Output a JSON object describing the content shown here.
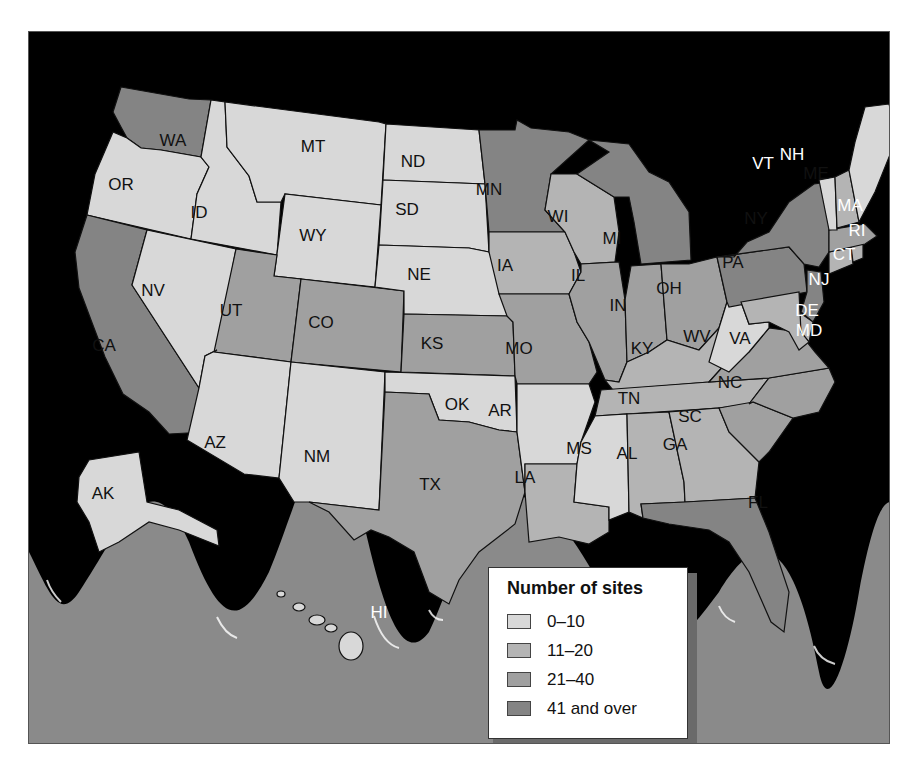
{
  "colors": {
    "frame_background": "#000000",
    "ocean_wave_band": "#8a8a8a",
    "outer_background": "#ffffff",
    "category_0_10": "#d8d8d8",
    "category_11_20": "#b4b4b4",
    "category_21_40": "#a0a0a0",
    "category_41_over": "#848484"
  },
  "legend": {
    "title": "Number of sites",
    "items": [
      {
        "label": "0–10",
        "color": "#d8d8d8"
      },
      {
        "label": "11–20",
        "color": "#b4b4b4"
      },
      {
        "label": "21–40",
        "color": "#a0a0a0"
      },
      {
        "label": "41 and over",
        "color": "#848484"
      }
    ]
  },
  "states": [
    {
      "code": "WA",
      "category": "41 and over"
    },
    {
      "code": "OR",
      "category": "0–10"
    },
    {
      "code": "CA",
      "category": "41 and over"
    },
    {
      "code": "ID",
      "category": "0–10"
    },
    {
      "code": "NV",
      "category": "0–10"
    },
    {
      "code": "MT",
      "category": "0–10"
    },
    {
      "code": "WY",
      "category": "0–10"
    },
    {
      "code": "UT",
      "category": "21–40"
    },
    {
      "code": "CO",
      "category": "21–40"
    },
    {
      "code": "AZ",
      "category": "0–10"
    },
    {
      "code": "NM",
      "category": "0–10"
    },
    {
      "code": "ND",
      "category": "0–10"
    },
    {
      "code": "SD",
      "category": "0–10"
    },
    {
      "code": "NE",
      "category": "0–10"
    },
    {
      "code": "KS",
      "category": "21–40"
    },
    {
      "code": "OK",
      "category": "0–10"
    },
    {
      "code": "TX",
      "category": "21–40"
    },
    {
      "code": "MN",
      "category": "41 and over"
    },
    {
      "code": "IA",
      "category": "11–20"
    },
    {
      "code": "MO",
      "category": "21–40"
    },
    {
      "code": "AR",
      "category": "0–10"
    },
    {
      "code": "LA",
      "category": "11–20"
    },
    {
      "code": "WI",
      "category": "11–20"
    },
    {
      "code": "IL",
      "category": "21–40"
    },
    {
      "code": "MI",
      "category": "41 and over"
    },
    {
      "code": "IN",
      "category": "21–40"
    },
    {
      "code": "OH",
      "category": "21–40"
    },
    {
      "code": "KY",
      "category": "11–20"
    },
    {
      "code": "TN",
      "category": "11–20"
    },
    {
      "code": "MS",
      "category": "0–10"
    },
    {
      "code": "AL",
      "category": "11–20"
    },
    {
      "code": "GA",
      "category": "11–20"
    },
    {
      "code": "FL",
      "category": "41 and over"
    },
    {
      "code": "SC",
      "category": "21–40"
    },
    {
      "code": "NC",
      "category": "21–40"
    },
    {
      "code": "VA",
      "category": "21–40"
    },
    {
      "code": "WV",
      "category": "0–10"
    },
    {
      "code": "PA",
      "category": "41 and over"
    },
    {
      "code": "NY",
      "category": "41 and over"
    },
    {
      "code": "NJ",
      "category": "41 and over"
    },
    {
      "code": "DE",
      "category": "11–20"
    },
    {
      "code": "MD",
      "category": "11–20"
    },
    {
      "code": "CT",
      "category": "11–20"
    },
    {
      "code": "RI",
      "category": "11–20"
    },
    {
      "code": "MA",
      "category": "21–40"
    },
    {
      "code": "VT",
      "category": "0–10"
    },
    {
      "code": "NH",
      "category": "11–20"
    },
    {
      "code": "ME",
      "category": "0–10"
    },
    {
      "code": "AK",
      "category": "0–10"
    },
    {
      "code": "HI",
      "category": "0–10"
    }
  ],
  "labels": {
    "WA": "WA",
    "OR": "OR",
    "CA": "CA",
    "ID": "ID",
    "NV": "NV",
    "MT": "MT",
    "WY": "WY",
    "UT": "UT",
    "CO": "CO",
    "AZ": "AZ",
    "NM": "NM",
    "ND": "ND",
    "SD": "SD",
    "NE": "NE",
    "KS": "KS",
    "OK": "OK",
    "TX": "TX",
    "MN": "MN",
    "IA": "IA",
    "MO": "MO",
    "AR": "AR",
    "LA": "LA",
    "WI": "WI",
    "IL": "IL",
    "MI": "MI",
    "IN": "IN",
    "OH": "OH",
    "KY": "KY",
    "TN": "TN",
    "MS": "MS",
    "AL": "AL",
    "GA": "GA",
    "FL": "FL",
    "SC": "SC",
    "NC": "NC",
    "VA": "VA",
    "WV": "WV",
    "PA": "PA",
    "NY": "NY",
    "NJ": "NJ",
    "DE": "DE",
    "MD": "MD",
    "CT": "CT",
    "RI": "RI",
    "MA": "MA",
    "VT": "VT",
    "NH": "NH",
    "ME": "ME",
    "AK": "AK",
    "HI": "HI"
  }
}
